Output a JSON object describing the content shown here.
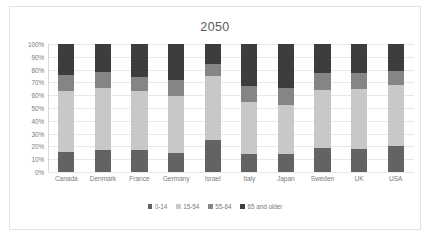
{
  "chart_data": {
    "type": "bar",
    "subtype": "stacked-100-percent",
    "title": "2050",
    "xlabel": "",
    "ylabel": "",
    "ylim": [
      0,
      100
    ],
    "ytick_labels": [
      "100%",
      "90%",
      "80%",
      "70%",
      "60%",
      "50%",
      "40%",
      "30%",
      "20%",
      "10%",
      "0%"
    ],
    "ytick_values": [
      100,
      90,
      80,
      70,
      60,
      50,
      40,
      30,
      20,
      10,
      0
    ],
    "grid": true,
    "legend_position": "bottom",
    "categories": [
      "Canada",
      "Denmark",
      "France",
      "Germany",
      "Israel",
      "Italy",
      "Japan",
      "Sweden",
      "UK",
      "USA"
    ],
    "series": [
      {
        "name": "0-14",
        "color": "#636363",
        "values": [
          16,
          17,
          17,
          15,
          25,
          14,
          14,
          19,
          18,
          20
        ]
      },
      {
        "name": "15-54",
        "color": "#c8c8c8",
        "values": [
          47,
          49,
          46,
          44,
          50,
          41,
          38,
          45,
          47,
          48
        ]
      },
      {
        "name": "55-64",
        "color": "#858585",
        "values": [
          13,
          12,
          11,
          13,
          9,
          12,
          14,
          13,
          12,
          11
        ]
      },
      {
        "name": "65 and older",
        "color": "#3d3d3d",
        "values": [
          24,
          22,
          26,
          28,
          16,
          33,
          34,
          23,
          23,
          21
        ]
      }
    ]
  },
  "colors": {
    "title_text": "#595959",
    "tick_text": "#7b7b7b",
    "gridline": "#e8e8e8",
    "chart_border": "#e2e2e2",
    "background": "#ffffff"
  }
}
